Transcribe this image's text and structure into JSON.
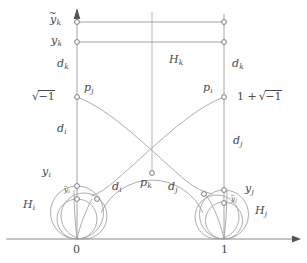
{
  "figure": {
    "kind": "hyperbolic-upper-half-plane-horoball-diagram",
    "width": 307,
    "height": 263,
    "stroke_color": "#8c8c8c",
    "axis_color": "#8a8a8a",
    "label_color": "#4a4a4a",
    "background": "#ffffff"
  },
  "axis": {
    "ticks": [
      {
        "label": "0",
        "x": 77
      },
      {
        "label": "1",
        "x": 224
      }
    ]
  },
  "labels": {
    "y_k_tilde": {
      "base": "y",
      "tilde": "~",
      "sub": "k"
    },
    "y_k": {
      "base": "y",
      "sub": "k"
    },
    "d_k_left": {
      "base": "d",
      "sub": "k"
    },
    "d_k_right": {
      "base": "d",
      "sub": "k"
    },
    "H_k": {
      "base": "H",
      "sub": "k"
    },
    "p_j": {
      "base": "p",
      "sub": "j"
    },
    "p_i": {
      "base": "p",
      "sub": "i"
    },
    "p_k": {
      "base": "p",
      "sub": "k"
    },
    "sqrt_minus_one": {
      "prefix": "",
      "sign": "√",
      "body": "−1"
    },
    "one_plus_sqrt_minus_one": {
      "prefix": "1 +",
      "sign": "√",
      "body": "−1"
    },
    "d_i_left": {
      "base": "d",
      "sub": "i"
    },
    "d_j_right": {
      "base": "d",
      "sub": "j"
    },
    "d_i_mid": {
      "base": "d",
      "sub": "i"
    },
    "d_j_mid": {
      "base": "d",
      "sub": "j"
    },
    "d_i_lower_left": {
      "base": "d",
      "sub": "i"
    },
    "y_i": {
      "base": "y",
      "sub": "i"
    },
    "y_j": {
      "base": "y",
      "sub": "j"
    },
    "y_i_tilde": {
      "base": "y",
      "tilde": "~",
      "sub": "i"
    },
    "y_j_tilde": {
      "base": "y",
      "tilde": "~",
      "sub": "j"
    },
    "H_i": {
      "base": "H",
      "sub": "i"
    },
    "H_j": {
      "base": "H",
      "sub": "j"
    }
  },
  "geometry": {
    "left_vertical_x": 77,
    "right_vertical_x": 224,
    "center_vertical_x": 152,
    "baseline_y": 239,
    "y_tilde_k_y": 22,
    "y_k_y": 42,
    "p_level_y": 97,
    "arc_crossing": {
      "x": 152,
      "y": 115
    },
    "p_k": {
      "x": 152,
      "y": 173
    },
    "left_horoball_top_y": 186,
    "left_horoball_inner_top_y": 199,
    "right_horoball_top_y": 190,
    "right_horoball_inner_top_y": 203
  }
}
